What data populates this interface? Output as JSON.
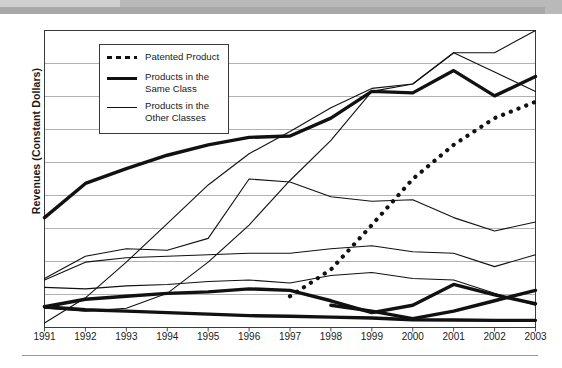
{
  "figure": {
    "top_band_color": "#b9b9b9",
    "plot_border_color": "#3a3a3a",
    "grid_color": "#a8a8a8",
    "line_color": "#111111"
  },
  "axes": {
    "ylabel": "Revenues (Constant Dollars)",
    "xlabel": "",
    "xticks": [
      "1991",
      "1992",
      "1993",
      "1994",
      "1995",
      "1996",
      "1997",
      "1998",
      "1999",
      "2000",
      "2001",
      "2002",
      "2003"
    ],
    "yticks": [],
    "grid": true,
    "grid_rows": 9
  },
  "legend": {
    "position": "upper-left-inside",
    "items": [
      {
        "key": "patented",
        "label": "Patented Product",
        "style": "dotted"
      },
      {
        "key": "same_class",
        "label": "Products in the\nSame Class",
        "style": "thick"
      },
      {
        "key": "other_class",
        "label": "Products in the\nOther Classes",
        "style": "thin"
      }
    ]
  },
  "chart_data": {
    "type": "line",
    "title": "",
    "xlabel": "",
    "ylabel": "Revenues (Constant Dollars)",
    "x": [
      1991,
      1992,
      1993,
      1994,
      1995,
      1996,
      1997,
      1998,
      1999,
      2000,
      2001,
      2002,
      2003
    ],
    "ylim": [
      0,
      100
    ],
    "xlim": [
      1991,
      2003
    ],
    "grid": true,
    "legend_position": "upper-left-inside",
    "series": [
      {
        "name": "Patented Product",
        "group": "Patented Product",
        "style": "dotted",
        "linewidth": 3.4,
        "x": [
          1997,
          1998,
          1999,
          2000,
          2001,
          2002,
          2003
        ],
        "values": [
          10.5,
          19.5,
          34.5,
          50.0,
          61.5,
          70.5,
          76.0
        ]
      },
      {
        "name": "Same Class A",
        "group": "Products in the Same Class",
        "style": "thick",
        "linewidth": 3.4,
        "x": [
          1991,
          1992,
          1993,
          1994,
          1995,
          1996,
          1997,
          1998,
          1999,
          2000,
          2001,
          2002,
          2003
        ],
        "values": [
          37.0,
          48.5,
          53.5,
          58.0,
          61.5,
          64.0,
          64.5,
          70.5,
          79.5,
          79.0,
          86.5,
          78.0,
          84.5
        ]
      },
      {
        "name": "Same Class B",
        "group": "Products in the Same Class",
        "style": "thick",
        "linewidth": 3.4,
        "x": [
          1991,
          1992,
          1993,
          1994,
          1995,
          1996,
          1997,
          1998,
          1999,
          2000,
          2001,
          2002,
          2003
        ],
        "values": [
          7.0,
          9.5,
          10.5,
          11.5,
          12.0,
          13.0,
          12.5,
          9.0,
          5.0,
          7.5,
          14.5,
          11.0,
          8.0
        ]
      },
      {
        "name": "Same Class C",
        "group": "Products in the Same Class",
        "style": "thick",
        "linewidth": 3.4,
        "x": [
          1991,
          1992,
          1993,
          1994,
          1995,
          1996,
          1997,
          1998,
          1999,
          2000,
          2001,
          2002,
          2003
        ],
        "values": [
          7.0,
          6.0,
          5.5,
          5.0,
          4.5,
          4.0,
          3.8,
          3.5,
          3.2,
          2.6,
          2.5,
          2.4,
          2.4
        ]
      },
      {
        "name": "Same Class D",
        "group": "Products in the Same Class",
        "style": "thick",
        "linewidth": 3.4,
        "x": [
          1998,
          1999,
          2000,
          2001,
          2002,
          2003
        ],
        "values": [
          7.5,
          5.5,
          3.0,
          5.5,
          9.0,
          12.5
        ]
      },
      {
        "name": "Other Class A",
        "group": "Products in the Other Classes",
        "style": "thin",
        "linewidth": 1.1,
        "x": [
          1991,
          1992,
          1993,
          1994,
          1995,
          1996,
          1997,
          1998,
          1999,
          2000,
          2001,
          2002,
          2003
        ],
        "values": [
          16.5,
          24.0,
          26.5,
          26.0,
          30.0,
          50.0,
          49.0,
          44.0,
          42.5,
          43.0,
          37.0,
          32.5,
          35.5
        ]
      },
      {
        "name": "Other Class B",
        "group": "Products in the Other Classes",
        "style": "thin",
        "linewidth": 1.1,
        "x": [
          1991,
          1992,
          1993,
          1994,
          1995,
          1996,
          1997,
          1998,
          1999,
          2000,
          2001,
          2002,
          2003
        ],
        "values": [
          16.0,
          22.0,
          23.5,
          24.0,
          24.5,
          25.0,
          25.0,
          26.5,
          27.5,
          25.5,
          25.0,
          20.5,
          24.5
        ]
      },
      {
        "name": "Other Class C",
        "group": "Products in the Other Classes",
        "style": "thin",
        "linewidth": 1.1,
        "x": [
          1991,
          1992,
          1993,
          1994,
          1995,
          1996,
          1997,
          1998,
          1999,
          2000,
          2001,
          2002,
          2003
        ],
        "values": [
          1.5,
          10.0,
          22.0,
          35.0,
          48.0,
          58.5,
          66.0,
          74.0,
          80.5,
          82.0,
          92.5,
          92.5,
          100.0
        ]
      },
      {
        "name": "Other Class D",
        "group": "Products in the Other Classes",
        "style": "thin",
        "linewidth": 1.1,
        "x": [
          1991,
          1992,
          1993,
          1994,
          1995,
          1996,
          1997,
          1998,
          1999,
          2000,
          2001,
          2002,
          2003
        ],
        "values": [
          6.5,
          5.5,
          6.5,
          11.5,
          22.0,
          34.5,
          49.5,
          63.0,
          79.5,
          82.0,
          92.5,
          86.0,
          79.5
        ]
      },
      {
        "name": "Other Class E",
        "group": "Products in the Other Classes",
        "style": "thin",
        "linewidth": 1.1,
        "x": [
          1991,
          1992,
          1993,
          1994,
          1995,
          1996,
          1997,
          1998,
          1999,
          2000,
          2001,
          2002,
          2003
        ],
        "values": [
          13.5,
          13.0,
          14.0,
          14.5,
          15.5,
          16.0,
          15.0,
          17.5,
          18.5,
          16.5,
          16.0,
          11.5,
          7.5
        ]
      }
    ]
  }
}
